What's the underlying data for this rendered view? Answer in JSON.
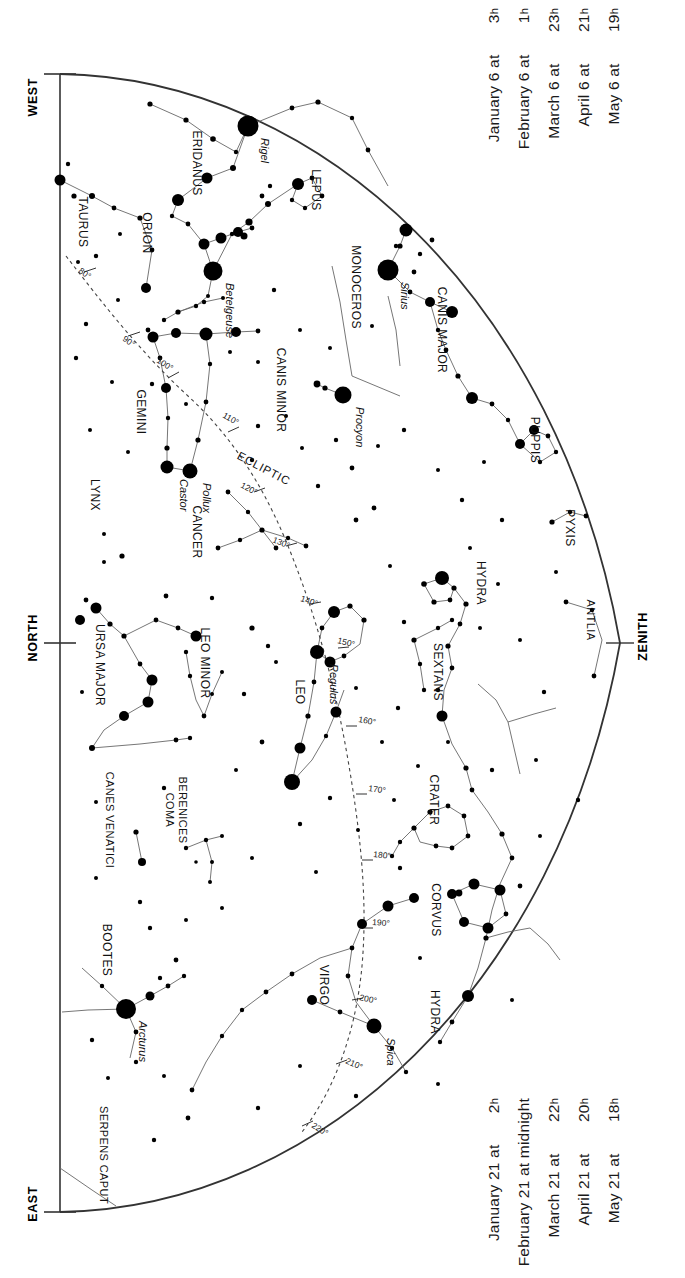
{
  "chart_data": {
    "type": "scatter",
    "projection": "half-dome horizon map",
    "xlabel": "",
    "ylabel": "",
    "grid": false,
    "legend_position": "none",
    "cardinals": [
      {
        "label": "WEST",
        "x": 40,
        "y": 105
      },
      {
        "label": "NORTH",
        "x": 40,
        "y": 640
      },
      {
        "label": "EAST",
        "x": 40,
        "y": 1212
      },
      {
        "label": "ZENITH",
        "x": 648,
        "y": 640
      }
    ],
    "ecliptic": {
      "label": "ECLIPTIC",
      "label_x": 262,
      "label_y": 472,
      "label_rot": -62,
      "ticks": [
        {
          "deg": "80°",
          "x": 78,
          "y": 272,
          "rot": -55
        },
        {
          "deg": "90°",
          "x": 122,
          "y": 340,
          "rot": -55
        },
        {
          "deg": "100°",
          "x": 156,
          "y": 362,
          "rot": -58
        },
        {
          "deg": "110°",
          "x": 222,
          "y": 417,
          "rot": -60
        },
        {
          "deg": "120°",
          "x": 240,
          "y": 487,
          "rot": -62
        },
        {
          "deg": "130°",
          "x": 272,
          "y": 542,
          "rot": -68
        },
        {
          "deg": "140°",
          "x": 300,
          "y": 601,
          "rot": -72
        },
        {
          "deg": "150°",
          "x": 337,
          "y": 643,
          "rot": -76
        },
        {
          "deg": "160°",
          "x": 358,
          "y": 722,
          "rot": -80
        },
        {
          "deg": "170°",
          "x": 368,
          "y": 791,
          "rot": -82
        },
        {
          "deg": "180°",
          "x": 373,
          "y": 857,
          "rot": -84
        },
        {
          "deg": "190°",
          "x": 372,
          "y": 925,
          "rot": -86
        },
        {
          "deg": "200°",
          "x": 359,
          "y": 1000,
          "rot": -78
        },
        {
          "deg": "210°",
          "x": 345,
          "y": 1063,
          "rot": -66
        },
        {
          "deg": "220°",
          "x": 311,
          "y": 1127,
          "rot": -58
        }
      ]
    },
    "constellations": [
      {
        "name": "ERIDANUS",
        "x": 193,
        "y": 163,
        "size": 12
      },
      {
        "name": "TAURUS",
        "x": 79,
        "y": 222,
        "size": 12
      },
      {
        "name": "ORION",
        "x": 143,
        "y": 233,
        "size": 12
      },
      {
        "name": "LEPUS",
        "x": 312,
        "y": 190,
        "size": 12
      },
      {
        "name": "MONOCEROS",
        "x": 352,
        "y": 287,
        "size": 12
      },
      {
        "name": "CANIS MAJOR",
        "x": 438,
        "y": 330,
        "size": 12
      },
      {
        "name": "CANIS MINOR",
        "x": 277,
        "y": 390,
        "size": 12
      },
      {
        "name": "GEMINI",
        "x": 137,
        "y": 412,
        "size": 12
      },
      {
        "name": "LYNX",
        "x": 91,
        "y": 495,
        "size": 12
      },
      {
        "name": "CANCER",
        "x": 193,
        "y": 532,
        "size": 12
      },
      {
        "name": "PUPPIS",
        "x": 531,
        "y": 440,
        "size": 12
      },
      {
        "name": "PYXIS",
        "x": 566,
        "y": 528,
        "size": 12
      },
      {
        "name": "HYDRA",
        "x": 477,
        "y": 583,
        "size": 12
      },
      {
        "name": "ANTLIA",
        "x": 587,
        "y": 620,
        "size": 11
      },
      {
        "name": "URSA MAJOR",
        "x": 96,
        "y": 665,
        "size": 12
      },
      {
        "name": "LEO MINOR",
        "x": 201,
        "y": 663,
        "size": 12
      },
      {
        "name": "LEO",
        "x": 296,
        "y": 692,
        "size": 12
      },
      {
        "name": "SEXTANS",
        "x": 434,
        "y": 672,
        "size": 12
      },
      {
        "name": "CRATER",
        "x": 430,
        "y": 800,
        "size": 12
      },
      {
        "name": "COMA BERENICES",
        "x": 172,
        "y": 810,
        "size": 11
      },
      {
        "name": "CANES VENATICI",
        "x": 106,
        "y": 820,
        "size": 11
      },
      {
        "name": "CORVUS",
        "x": 432,
        "y": 910,
        "size": 12
      },
      {
        "name": "BOOTES",
        "x": 103,
        "y": 950,
        "size": 12
      },
      {
        "name": "VIRGO",
        "x": 320,
        "y": 985,
        "size": 12
      },
      {
        "name": "HYDRA",
        "x": 431,
        "y": 1012,
        "size": 12
      },
      {
        "name": "SERPENS CAPUT",
        "x": 100,
        "y": 1155,
        "size": 11
      }
    ],
    "named_stars": [
      {
        "name": "Rigel",
        "x": 248,
        "y": 126,
        "mag": 0.1
      },
      {
        "name": "Betelgeuse",
        "x": 213,
        "y": 271,
        "mag": 0.5
      },
      {
        "name": "Sirius",
        "x": 388,
        "y": 270,
        "mag": -1.5
      },
      {
        "name": "Procyon",
        "x": 343,
        "y": 395,
        "mag": 0.4
      },
      {
        "name": "Castor",
        "x": 167,
        "y": 467,
        "mag": 1.6
      },
      {
        "name": "Pollux",
        "x": 190,
        "y": 471,
        "mag": 1.1
      },
      {
        "name": "Regulus",
        "x": 317,
        "y": 652,
        "mag": 1.4
      },
      {
        "name": "Arcturus",
        "x": 126,
        "y": 1009,
        "mag": 0.0
      },
      {
        "name": "Spica",
        "x": 374,
        "y": 1026,
        "mag": 1.0
      }
    ]
  },
  "dates": {
    "top": {
      "lines": [
        {
          "date": "January 6 at",
          "hour": "3"
        },
        {
          "date": "February 6 at",
          "hour": "1"
        },
        {
          "date": "March 6 at",
          "hour": "23"
        },
        {
          "date": "April 6 at",
          "hour": "21"
        },
        {
          "date": "May 6 at",
          "hour": "19"
        }
      ]
    },
    "bottom": {
      "lines": [
        {
          "date": "January 21 at",
          "hour": "2"
        },
        {
          "date": "February 21 at midnight",
          "hour": ""
        },
        {
          "date": "March 21 at",
          "hour": "22"
        },
        {
          "date": "April 21 at",
          "hour": "20"
        },
        {
          "date": "May 21 at",
          "hour": "18"
        }
      ]
    },
    "hour_suffix": "h"
  },
  "colors": {
    "ink": "#000000",
    "line": "#555555",
    "horizon": "#333333",
    "paper": "#ffffff"
  }
}
